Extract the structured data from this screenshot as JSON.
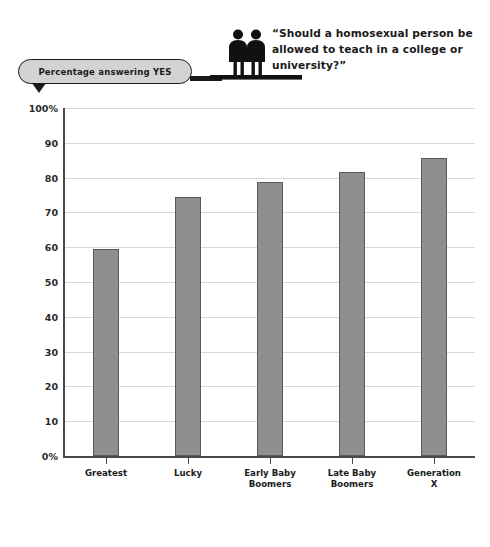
{
  "header": {
    "badge_label": "Percentage answering YES",
    "question": "“Should a homosexual person be allowed to teach in a college or university?”",
    "icon_name": "two-people-icon"
  },
  "colors": {
    "bar_fill": "#8f8f8f",
    "bar_border": "#5a5a5a",
    "badge_fill": "#d3d3d3",
    "ink": "#1a1a1a",
    "gridline": "#d8d8d8",
    "axis": "#4a4a4a",
    "background": "#ffffff"
  },
  "chart_data": {
    "type": "bar",
    "title": "“Should a homosexual person be allowed to teach in a college or university?”",
    "subtitle": "Percentage answering YES",
    "categories": [
      "Greatest",
      "Lucky",
      "Early Baby Boomers",
      "Late Baby Boomers",
      "Generation X"
    ],
    "category_lines": [
      [
        "Greatest"
      ],
      [
        "Lucky"
      ],
      [
        "Early Baby",
        "Boomers"
      ],
      [
        "Late Baby",
        "Boomers"
      ],
      [
        "Generation",
        "X"
      ]
    ],
    "values": [
      59.5,
      74.5,
      78.8,
      81.5,
      85.5
    ],
    "xlabel": "",
    "ylabel": "Percentage answering YES",
    "ylim": [
      0,
      100
    ],
    "ytick_values": [
      0,
      10,
      20,
      30,
      40,
      50,
      60,
      70,
      80,
      90,
      100
    ],
    "ytick_labels": [
      "0%",
      "10",
      "20",
      "30",
      "40",
      "50",
      "60",
      "70",
      "80",
      "90",
      "100%"
    ],
    "grid": true,
    "legend": "none"
  }
}
